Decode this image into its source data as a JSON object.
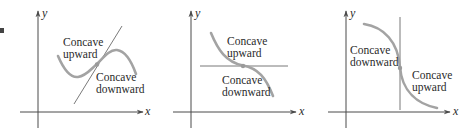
{
  "figure": {
    "margin_marker": "■",
    "colors": {
      "axis": "#4a4a4a",
      "tangent": "#6a6a6a",
      "curve": "#a3a3a3",
      "text": "#2a2a2a"
    },
    "panels": [
      {
        "id": "panel-1",
        "x_axis_label": "x",
        "y_axis_label": "y",
        "tangent_type": "slanted",
        "region_labels": [
          {
            "line1": "Concave",
            "line2": "upward"
          },
          {
            "line1": "Concave",
            "line2": "downward"
          }
        ]
      },
      {
        "id": "panel-2",
        "x_axis_label": "x",
        "y_axis_label": "y",
        "tangent_type": "horizontal",
        "region_labels": [
          {
            "line1": "Concave",
            "line2": "upward"
          },
          {
            "line1": "Concave",
            "line2": "downward"
          }
        ]
      },
      {
        "id": "panel-3",
        "x_axis_label": "x",
        "y_axis_label": "y",
        "tangent_type": "vertical",
        "region_labels": [
          {
            "line1": "Concave",
            "line2": "downward"
          },
          {
            "line1": "Concave",
            "line2": "upward"
          }
        ]
      }
    ]
  }
}
